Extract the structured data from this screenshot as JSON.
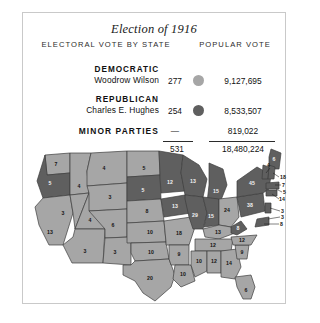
{
  "title": "Election of 1916",
  "columns": {
    "electoral": "ELECTORAL VOTE BY STATE",
    "popular": "POPULAR VOTE"
  },
  "parties": [
    {
      "party": "DEMOCRATIC",
      "candidate": "Woodrow Wilson",
      "electoral": "277",
      "popular": "9,127,695",
      "color": "#a6a6a6",
      "swatch_name": "democratic-color-dot"
    },
    {
      "party": "REPUBLICAN",
      "candidate": "Charles E. Hughes",
      "electoral": "254",
      "popular": "8,533,507",
      "color": "#5f5f5f",
      "swatch_name": "republican-color-dot"
    },
    {
      "party": "MINOR PARTIES",
      "candidate": "",
      "electoral": "—",
      "popular": "819,022",
      "color": "",
      "swatch_name": ""
    }
  ],
  "totals": {
    "electoral": "531",
    "popular": "18,480,224"
  },
  "map": {
    "colors": {
      "democratic": "#a6a6a6",
      "republican": "#5f5f5f",
      "border": "#3d3d3d"
    },
    "states": [
      {
        "code": "WA",
        "label": "7",
        "winner": "democratic",
        "x": 33,
        "y": 23
      },
      {
        "code": "OR",
        "label": "5",
        "winner": "republican",
        "x": 27,
        "y": 42
      },
      {
        "code": "CA",
        "label": "13",
        "winner": "democratic",
        "x": 27,
        "y": 91
      },
      {
        "code": "ID",
        "label": "4",
        "winner": "democratic",
        "x": 56,
        "y": 45
      },
      {
        "code": "NV",
        "label": "3",
        "winner": "democratic",
        "x": 40,
        "y": 72
      },
      {
        "code": "UT",
        "label": "4",
        "winner": "democratic",
        "x": 67,
        "y": 79
      },
      {
        "code": "AZ",
        "label": "3",
        "winner": "democratic",
        "x": 62,
        "y": 110
      },
      {
        "code": "MT",
        "label": "4",
        "winner": "democratic",
        "x": 81,
        "y": 27
      },
      {
        "code": "WY",
        "label": "3",
        "winner": "democratic",
        "x": 87,
        "y": 56
      },
      {
        "code": "CO",
        "label": "6",
        "winner": "democratic",
        "x": 90,
        "y": 84
      },
      {
        "code": "NM",
        "label": "3",
        "winner": "democratic",
        "x": 90,
        "y": 111
      },
      {
        "code": "ND",
        "label": "5",
        "winner": "democratic",
        "x": 121,
        "y": 27
      },
      {
        "code": "SD",
        "label": "5",
        "winner": "republican",
        "x": 120,
        "y": 49
      },
      {
        "code": "NE",
        "label": "8",
        "winner": "democratic",
        "x": 124,
        "y": 70
      },
      {
        "code": "KS",
        "label": "10",
        "winner": "democratic",
        "x": 127,
        "y": 91
      },
      {
        "code": "OK",
        "label": "10",
        "winner": "democratic",
        "x": 136,
        "y": 111
      },
      {
        "code": "TX",
        "label": "20",
        "winner": "democratic",
        "x": 127,
        "y": 139
      },
      {
        "code": "MN",
        "label": "12",
        "winner": "republican",
        "x": 147,
        "y": 41
      },
      {
        "code": "IA",
        "label": "13",
        "winner": "republican",
        "x": 152,
        "y": 65
      },
      {
        "code": "MO",
        "label": "18",
        "winner": "democratic",
        "x": 158,
        "y": 92
      },
      {
        "code": "AR",
        "label": "9",
        "winner": "democratic",
        "x": 161,
        "y": 114
      },
      {
        "code": "LA",
        "label": "10",
        "winner": "democratic",
        "x": 163,
        "y": 134
      },
      {
        "code": "WI",
        "label": "13",
        "winner": "republican",
        "x": 170,
        "y": 45
      },
      {
        "code": "IL",
        "label": "29",
        "winner": "republican",
        "x": 171,
        "y": 74
      },
      {
        "code": "MI",
        "label": "15",
        "winner": "republican",
        "x": 190,
        "y": 56
      },
      {
        "code": "IN",
        "label": "15",
        "winner": "republican",
        "x": 188,
        "y": 75
      },
      {
        "code": "KY",
        "label": "13",
        "winner": "democratic",
        "x": 197,
        "y": 92
      },
      {
        "code": "TN",
        "label": "12",
        "winner": "democratic",
        "x": 192,
        "y": 105
      },
      {
        "code": "MS",
        "label": "10",
        "winner": "democratic",
        "x": 175,
        "y": 124
      },
      {
        "code": "AL",
        "label": "12",
        "winner": "democratic",
        "x": 190,
        "y": 124
      },
      {
        "code": "GA",
        "label": "14",
        "winner": "democratic",
        "x": 208,
        "y": 124
      },
      {
        "code": "SC",
        "label": "9",
        "winner": "democratic",
        "x": 220,
        "y": 114
      },
      {
        "code": "NC",
        "label": "12",
        "winner": "democratic",
        "x": 219,
        "y": 102
      },
      {
        "code": "FL",
        "label": "6",
        "winner": "democratic",
        "x": 222,
        "y": 152
      },
      {
        "code": "OH",
        "label": "24",
        "winner": "democratic",
        "x": 204,
        "y": 72
      },
      {
        "code": "WV",
        "label": "8",
        "winner": "republican",
        "x": 212,
        "y": 84
      },
      {
        "code": "PA",
        "label": "38",
        "winner": "republican",
        "x": 227,
        "y": 63
      },
      {
        "code": "NY",
        "label": "45",
        "winner": "republican",
        "x": 231,
        "y": 42
      },
      {
        "code": "ME",
        "label": "6",
        "winner": "republican",
        "x": 251,
        "y": 17
      }
    ],
    "leader_labels": [
      {
        "code": "VT",
        "label": "4",
        "x": 243,
        "y": 34
      },
      {
        "code": "NH",
        "label": "18",
        "x": 257,
        "y": 35
      },
      {
        "code": "MA",
        "label": "7",
        "x": 250,
        "y": 54
      },
      {
        "code": "RI",
        "label": "5",
        "x": 256,
        "y": 50
      },
      {
        "code": "CT",
        "label": "14",
        "x": 249,
        "y": 62
      },
      {
        "code": "NJ",
        "label": "3",
        "x": 251,
        "y": 72
      },
      {
        "code": "DE",
        "label": "3",
        "x": 249,
        "y": 79
      },
      {
        "code": "MD",
        "label": "8",
        "x": 247,
        "y": 80
      }
    ]
  }
}
